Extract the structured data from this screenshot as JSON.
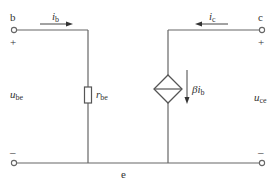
{
  "diagram": {
    "terminals": {
      "base": "b",
      "collector": "c",
      "emitter": "e"
    },
    "polarity": {
      "plus": "+",
      "minus": "–"
    },
    "currents": {
      "base_current": {
        "main": "i",
        "sub": "b"
      },
      "collector_current": {
        "main": "i",
        "sub": "c"
      }
    },
    "voltages": {
      "input_voltage": {
        "main": "u",
        "sub": "be"
      },
      "output_voltage": {
        "main": "u",
        "sub": "ce"
      }
    },
    "components": {
      "resistor": {
        "main": "r",
        "sub": "be"
      },
      "dependent_source": {
        "beta": "β",
        "main": "i",
        "sub": "b"
      }
    },
    "colors": {
      "wire": "#666666",
      "text": "#333333",
      "background": "#ffffff"
    }
  }
}
